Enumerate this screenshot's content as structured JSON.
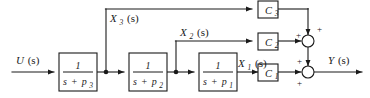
{
  "diagram": {
    "type": "control-system-block-diagram",
    "colors": {
      "line": "#1a1a1a",
      "background": "#ffffff",
      "box_fill": "#ffffff"
    },
    "input": {
      "label_var": "U",
      "label_arg": "(s)"
    },
    "output": {
      "label_var": "Y",
      "label_arg": "(s)"
    },
    "transfer_blocks": [
      {
        "id": "block-p3",
        "numerator": "1",
        "denominator_s": "s",
        "denominator_plus": "+",
        "denominator_p": "p",
        "denominator_sub": "3",
        "denominator_full": "s + p3"
      },
      {
        "id": "block-p2",
        "numerator": "1",
        "denominator_s": "s",
        "denominator_plus": "+",
        "denominator_p": "p",
        "denominator_sub": "2",
        "denominator_full": "s + p2"
      },
      {
        "id": "block-p1",
        "numerator": "1",
        "denominator_s": "s",
        "denominator_plus": "+",
        "denominator_p": "p",
        "denominator_sub": "1",
        "denominator_full": "s + p1"
      }
    ],
    "state_signals": [
      {
        "id": "x3",
        "var": "X",
        "sub": "3",
        "arg": "(s)",
        "full": "X3(s)"
      },
      {
        "id": "x2",
        "var": "X",
        "sub": "2",
        "arg": "(s)",
        "full": "X2(s)"
      },
      {
        "id": "x1",
        "var": "X",
        "sub": "1",
        "arg": "(s)",
        "full": "X1(s)"
      }
    ],
    "gain_blocks": [
      {
        "id": "gain-c3",
        "var": "C",
        "sub": "3",
        "full": "C3"
      },
      {
        "id": "gain-c2",
        "var": "C",
        "sub": "2",
        "full": "C2"
      },
      {
        "id": "gain-c1",
        "var": "C",
        "sub": "1",
        "full": "C1"
      }
    ],
    "summing_junctions": [
      {
        "id": "sum-upper",
        "signs": [
          "+",
          "+"
        ]
      },
      {
        "id": "sum-lower",
        "signs": [
          "+",
          "+"
        ]
      }
    ]
  }
}
